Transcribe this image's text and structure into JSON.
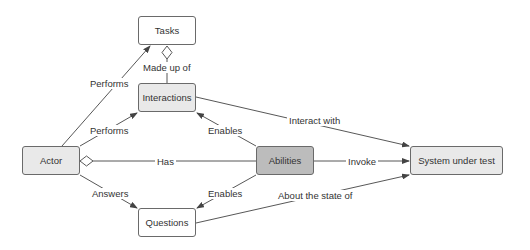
{
  "diagram": {
    "colors": {
      "line": "#444444",
      "border": "#6a6a6a",
      "white_fill": "#ffffff",
      "light_fill": "#e9e9e9",
      "dark_fill": "#bcbcbc",
      "text": "#333333"
    },
    "nodes": {
      "tasks": {
        "label": "Tasks"
      },
      "interactions": {
        "label": "Interactions"
      },
      "actor": {
        "label": "Actor"
      },
      "abilities": {
        "label": "Abilities"
      },
      "system": {
        "label": "System under test"
      },
      "questions": {
        "label": "Questions"
      }
    },
    "edges": {
      "actor_tasks": {
        "label": "Performs"
      },
      "interactions_tasks": {
        "label": "Made up of"
      },
      "actor_interactions": {
        "label": "Performs"
      },
      "interactions_system": {
        "label": "Interact with"
      },
      "abilities_interactions": {
        "label": "Enables"
      },
      "abilities_actor": {
        "label": "Has"
      },
      "abilities_system": {
        "label": "Invoke"
      },
      "actor_questions": {
        "label": "Answers"
      },
      "abilities_questions": {
        "label": "Enables"
      },
      "questions_system": {
        "label": "About the state of"
      }
    }
  }
}
